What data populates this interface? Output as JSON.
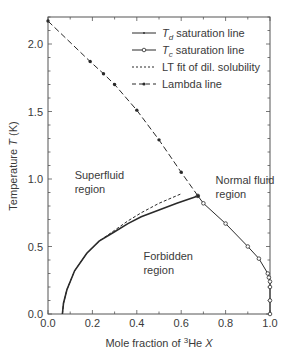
{
  "chart_data": {
    "type": "line",
    "title": "",
    "xlabel": "Mole fraction of ³He X",
    "xlabel_parts": {
      "prefix": "Mole fraction of ",
      "sup": "3",
      "mid": "He ",
      "italic": "X"
    },
    "ylabel": "Temperature T (K)",
    "ylabel_parts": {
      "prefix": "Temperature ",
      "italic": "T",
      "suffix": " (K)"
    },
    "xlim": [
      0.0,
      1.0
    ],
    "ylim": [
      0.0,
      2.2
    ],
    "xticks": [
      "0.0",
      "0.2",
      "0.4",
      "0.6",
      "0.8",
      "1.0"
    ],
    "xtick_values": [
      0.0,
      0.2,
      0.4,
      0.6,
      0.8,
      1.0
    ],
    "yticks": [
      "0.0",
      "0.5",
      "1.0",
      "1.5",
      "2.0"
    ],
    "ytick_values": [
      0.0,
      0.5,
      1.0,
      1.5,
      2.0
    ],
    "grid": false,
    "legend_position": "upper right",
    "series": [
      {
        "name": "Td saturation line",
        "legend_main": "T",
        "legend_sub": "d",
        "legend_rest": " saturation line",
        "style": "solid",
        "marker": "small-dot",
        "x": [
          0.065,
          0.07,
          0.085,
          0.12,
          0.175,
          0.23,
          0.3,
          0.36,
          0.42,
          0.5,
          0.58,
          0.675
        ],
        "y": [
          0.0,
          0.08,
          0.18,
          0.32,
          0.45,
          0.54,
          0.61,
          0.67,
          0.72,
          0.77,
          0.82,
          0.875
        ]
      },
      {
        "name": "Tc saturation line",
        "legend_main": "T",
        "legend_sub": "c",
        "legend_rest": " saturation line",
        "style": "solid",
        "marker": "open-circle",
        "x": [
          0.675,
          0.7,
          0.8,
          0.9,
          0.95,
          0.99,
          0.995,
          1.0,
          1.0,
          1.0,
          1.0
        ],
        "y": [
          0.875,
          0.82,
          0.67,
          0.5,
          0.41,
          0.3,
          0.27,
          0.24,
          0.2,
          0.1,
          0.0
        ]
      },
      {
        "name": "LT fit of dil. solubility",
        "legend_main": "LT fit of dil. solubility",
        "style": "dashed-fine",
        "marker": "none",
        "x": [
          0.065,
          0.07,
          0.085,
          0.12,
          0.175,
          0.23,
          0.3,
          0.36,
          0.42,
          0.5,
          0.6
        ],
        "y": [
          0.0,
          0.08,
          0.18,
          0.32,
          0.45,
          0.54,
          0.62,
          0.69,
          0.75,
          0.82,
          0.89
        ]
      },
      {
        "name": "Lambda line",
        "legend_main": "Lambda line",
        "style": "dashed",
        "marker": "filled-dot",
        "x": [
          0.0,
          0.19,
          0.25,
          0.3,
          0.4,
          0.5,
          0.6,
          0.675
        ],
        "y": [
          2.17,
          1.87,
          1.78,
          1.7,
          1.51,
          1.29,
          1.05,
          0.875
        ]
      }
    ],
    "annotations": [
      {
        "text": [
          "Superfluid",
          "region"
        ],
        "x": 0.12,
        "y": 1.0
      },
      {
        "text": [
          "Normal fluid",
          "region"
        ],
        "x": 0.755,
        "y": 0.96
      },
      {
        "text": [
          "Forbidden",
          "region"
        ],
        "x": 0.43,
        "y": 0.4
      }
    ]
  },
  "colors": {
    "line": "#2a2a2a",
    "text": "#3a3a3a",
    "axis": "#555555",
    "background": "#ffffff"
  }
}
